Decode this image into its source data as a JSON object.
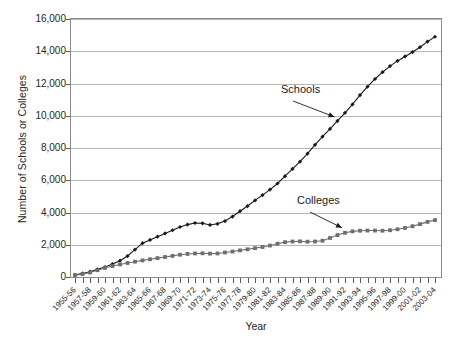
{
  "chart_data": {
    "type": "line",
    "title": "",
    "xlabel": "Year",
    "ylabel": "Number of Schools or Colleges",
    "ylim": [
      0,
      16000
    ],
    "ytick_values": [
      0,
      2000,
      4000,
      6000,
      8000,
      10000,
      12000,
      14000,
      16000
    ],
    "ytick_labels": [
      "0",
      "2,000",
      "4,000",
      "6,000",
      "8,000",
      "10,000",
      "12,000",
      "14,000",
      "16,000"
    ],
    "grid": true,
    "legend_position": "annotations",
    "x": [
      "1955-56",
      "1956-57",
      "1957-58",
      "1958-59",
      "1959-60",
      "1960-61",
      "1961-62",
      "1962-63",
      "1963-64",
      "1964-65",
      "1965-66",
      "1966-67",
      "1967-68",
      "1968-69",
      "1969-70",
      "1970-71",
      "1971-72",
      "1972-73",
      "1973-74",
      "1974-75",
      "1975-76",
      "1976-77",
      "1977-78",
      "1978-79",
      "1979-80",
      "1980-81",
      "1981-82",
      "1982-83",
      "1983-84",
      "1984-85",
      "1985-86",
      "1986-87",
      "1987-88",
      "1988-89",
      "1989-90",
      "1990-91",
      "1991-92",
      "1992-93",
      "1993-94",
      "1994-95",
      "1995-96",
      "1996-97",
      "1997-98",
      "1998-99",
      "1999-00",
      "2000-01",
      "2001-02",
      "2002-03",
      "2003-04"
    ],
    "xtick_labels_shown": [
      "1955-56",
      "1957-58",
      "1959-60",
      "1961-62",
      "1963-64",
      "1965-66",
      "1967-68",
      "1969-70",
      "1971-72",
      "1973-74",
      "1975-76",
      "1977-78",
      "1979-80",
      "1981-82",
      "1983-84",
      "1985-86",
      "1987-88",
      "1989-90",
      "1991-92",
      "1993-94",
      "1995-96",
      "1997-98",
      "1999-00",
      "2001-02",
      "2003-04"
    ],
    "series": [
      {
        "name": "Schools",
        "marker": "diamond",
        "color": "#1a1a1a",
        "values": [
          140,
          220,
          330,
          480,
          620,
          800,
          1010,
          1300,
          1700,
          2100,
          2300,
          2500,
          2700,
          2900,
          3100,
          3250,
          3350,
          3330,
          3230,
          3300,
          3470,
          3750,
          4080,
          4400,
          4750,
          5080,
          5420,
          5800,
          6250,
          6700,
          7150,
          7650,
          8200,
          8700,
          9180,
          9680,
          10180,
          10700,
          11280,
          11800,
          12280,
          12700,
          13080,
          13400,
          13680,
          13950,
          14250,
          14600,
          14900
        ]
      },
      {
        "name": "Colleges",
        "marker": "square",
        "color": "#6e6e6e",
        "values": [
          110,
          180,
          280,
          420,
          560,
          680,
          780,
          870,
          950,
          1030,
          1100,
          1170,
          1240,
          1310,
          1380,
          1430,
          1460,
          1470,
          1450,
          1460,
          1520,
          1580,
          1650,
          1720,
          1790,
          1860,
          1950,
          2060,
          2160,
          2200,
          2210,
          2190,
          2200,
          2250,
          2420,
          2600,
          2740,
          2830,
          2870,
          2880,
          2880,
          2870,
          2900,
          2960,
          3040,
          3150,
          3280,
          3420,
          3530
        ]
      }
    ],
    "annotations": [
      {
        "id": "schools",
        "text": "Schools",
        "points_to_series": "Schools",
        "points_to_x": "1990-91",
        "points_to_value": 9680
      },
      {
        "id": "colleges",
        "text": "Colleges",
        "points_to_series": "Colleges",
        "points_to_x": "1991-92",
        "points_to_value": 2740
      }
    ]
  }
}
